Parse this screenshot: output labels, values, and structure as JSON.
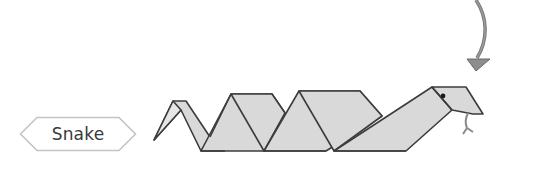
{
  "label": {
    "text": "Snake"
  },
  "figure": {
    "icon": "snake-illustration",
    "arrow_icon": "curved-arrow-down",
    "colors": {
      "fill": "#d9d9d9",
      "outline": "#3c3c3c",
      "arrow": "#8a8a8a",
      "tag_border": "#c8c8c8",
      "tongue": "#8a8a8a"
    }
  }
}
